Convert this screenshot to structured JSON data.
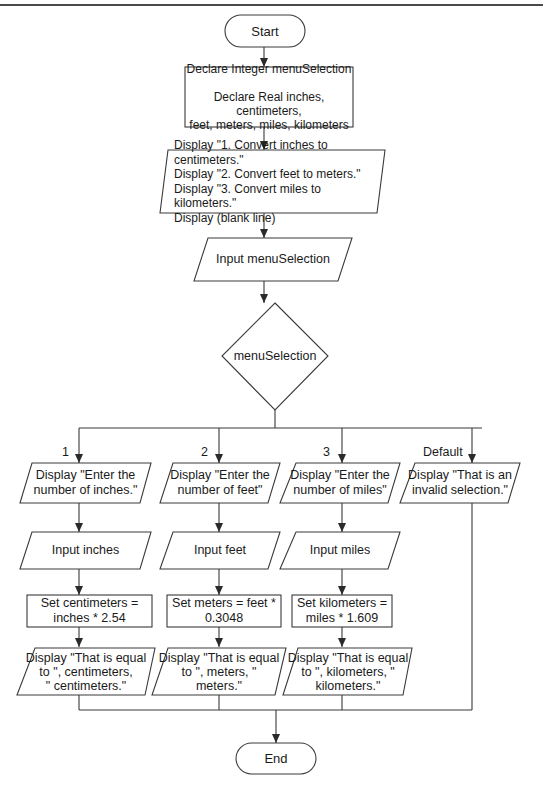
{
  "flowchart": {
    "start": "Start",
    "end": "End",
    "declare": "Declare Integer menuSelection\n\nDeclare Real inches, centimeters,\nfeet, meters, miles, kilometers",
    "menu_display": "Display \"1. Convert inches to centimeters.\"\nDisplay \"2. Convert feet to meters.\"\nDisplay \"3. Convert miles to kilometers.\"\nDisplay (blank line)",
    "menu_input": "Input menuSelection",
    "decision": "menuSelection",
    "cases": [
      {
        "label": "1",
        "prompt": "Display \"Enter the\nnumber of inches.\"",
        "input": "Input inches",
        "process": "Set centimeters =\ninches * 2.54",
        "output": "Display \"That is equal\nto \", centimeters,\n\" centimeters.\""
      },
      {
        "label": "2",
        "prompt": "Display \"Enter the\nnumber of feet\"",
        "input": "Input feet",
        "process": "Set meters = feet *\n0.3048",
        "output": "Display \"That is equal\nto \", meters, \"\nmeters.\""
      },
      {
        "label": "3",
        "prompt": "Display \"Enter the\nnumber of miles\"",
        "input": "Input miles",
        "process": "Set kilometers =\nmiles * 1.609",
        "output": "Display \"That is equal\nto \", kilometers, \"\nkilometers.\""
      },
      {
        "label": "Default",
        "prompt": "Display \"That is an\ninvalid selection.\""
      }
    ]
  },
  "colors": {
    "stroke": "#3a3a3a",
    "background": "#ffffff",
    "text": "#1a1a1a"
  }
}
